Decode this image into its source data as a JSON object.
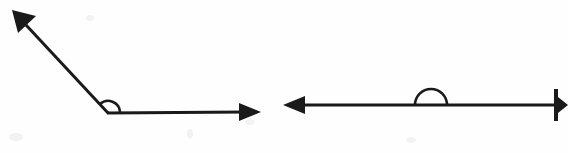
{
  "figure": {
    "background_color": "#fefefe",
    "ink_color": "#1a1a1a",
    "stroke_width": 3,
    "canvas": {
      "width": 568,
      "height": 153
    },
    "diagrams": [
      {
        "id": "obtuse-angle",
        "label": "Obtuse angle formed by two rays meeting at a vertex",
        "angle_type": "obtuse",
        "angle_degrees": 135,
        "vertex": {
          "x": 108,
          "y": 113
        },
        "rays": [
          {
            "id": "upper-left-ray",
            "from": {
              "x": 108,
              "y": 113
            },
            "to": {
              "x": 18,
              "y": 17
            },
            "direction_degrees": 133,
            "arrowhead": "true",
            "arrowhead_at": "to"
          },
          {
            "id": "horizontal-right-ray",
            "from": {
              "x": 108,
              "y": 113
            },
            "to": {
              "x": 258,
              "y": 112
            },
            "direction_degrees": 0,
            "arrowhead": "true",
            "arrowhead_at": "to"
          }
        ],
        "arc": {
          "id": "obtuse-angle-arc",
          "center": {
            "x": 108,
            "y": 113
          },
          "radius": 12,
          "start_degrees": 0,
          "end_degrees": 133
        }
      },
      {
        "id": "straight-angle",
        "label": "Straight angle formed by a single line through a vertex",
        "angle_type": "straight",
        "angle_degrees": 180,
        "vertex": {
          "x": 431,
          "y": 105
        },
        "rays": [
          {
            "id": "leftward-ray",
            "from": {
              "x": 431,
              "y": 105
            },
            "to": {
              "x": 285,
              "y": 105
            },
            "direction_degrees": 180,
            "arrowhead": "true",
            "arrowhead_at": "to"
          },
          {
            "id": "rightward-ray",
            "from": {
              "x": 431,
              "y": 105
            },
            "to": {
              "x": 560,
              "y": 105
            },
            "direction_degrees": 0,
            "arrowhead": "true",
            "arrowhead_at": "to"
          }
        ],
        "arc": {
          "id": "straight-angle-arc",
          "center": {
            "x": 431,
            "y": 105
          },
          "radius": 16,
          "start_degrees": 0,
          "end_degrees": 180
        }
      }
    ]
  }
}
